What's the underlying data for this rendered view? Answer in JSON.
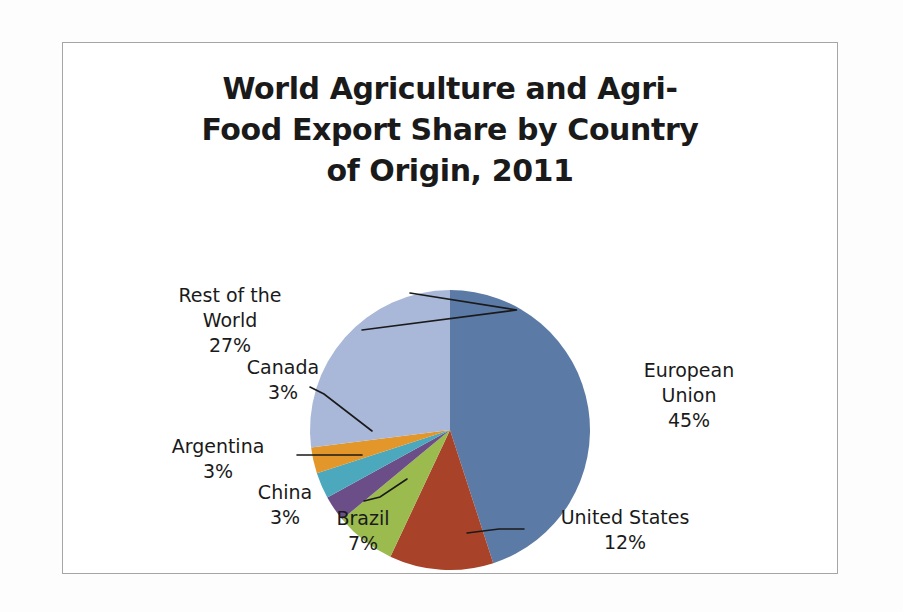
{
  "chart_data": {
    "type": "pie",
    "title": "World Agriculture and Agri-\nFood Export Share by Country\nof Origin, 2011",
    "title_lines": [
      "World Agriculture and Agri-",
      "Food Export Share by Country",
      "of Origin, 2011"
    ],
    "xlabel": "",
    "ylabel": "",
    "legend": "none",
    "grid": false,
    "units": "percent",
    "total": 100,
    "start_angle_deg": 0,
    "direction": "clockwise",
    "categories": [
      "European Union",
      "United States",
      "Brazil",
      "China",
      "Argentina",
      "Canada",
      "Rest of the World"
    ],
    "values": [
      45,
      12,
      7,
      3,
      3,
      3,
      27
    ],
    "colors": [
      "#5b7ba6",
      "#a8432a",
      "#9bbb4f",
      "#6b4e87",
      "#4ca9bd",
      "#e39629",
      "#a9b8d8"
    ],
    "slices": [
      {
        "name": "European Union",
        "value": 45,
        "label": "European\nUnion\n45%",
        "percent_text": "45%",
        "color": "#5b7ba6",
        "leader": false
      },
      {
        "name": "United States",
        "value": 12,
        "label": "United States\n12%",
        "percent_text": "12%",
        "color": "#a8432a",
        "leader": true
      },
      {
        "name": "Brazil",
        "value": 7,
        "label": "Brazil\n7%",
        "percent_text": "7%",
        "color": "#9bbb4f",
        "leader": false
      },
      {
        "name": "China",
        "value": 3,
        "label": "China\n3%",
        "percent_text": "3%",
        "color": "#6b4e87",
        "leader": true
      },
      {
        "name": "Argentina",
        "value": 3,
        "label": "Argentina\n3%",
        "percent_text": "3%",
        "color": "#4ca9bd",
        "leader": true
      },
      {
        "name": "Canada",
        "value": 3,
        "label": "Canada\n3%",
        "percent_text": "3%",
        "color": "#e39629",
        "leader": true
      },
      {
        "name": "Rest of the World",
        "value": 27,
        "label": "Rest of the\nWorld\n27%",
        "percent_text": "27%",
        "color": "#a9b8d8",
        "leader": true
      }
    ]
  },
  "labels": {
    "european_union": "European\nUnion\n45%",
    "united_states": "United States\n12%",
    "brazil": "Brazil\n7%",
    "china": "China\n3%",
    "argentina": "Argentina\n3%",
    "canada": "Canada\n3%",
    "rest_of_world": "Rest of the\nWorld\n27%"
  }
}
